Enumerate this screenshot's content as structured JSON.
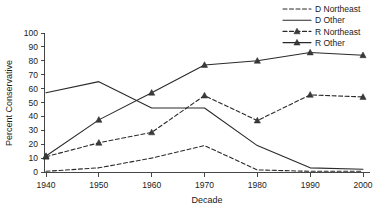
{
  "chart_data": {
    "type": "line",
    "title": "",
    "xlabel": "Decade",
    "ylabel": "Percent Conservative",
    "x": [
      1940,
      1950,
      1960,
      1970,
      1980,
      1990,
      2000
    ],
    "xticklabels": [
      "1940",
      "1950",
      "1960",
      "1970",
      "1980",
      "1990",
      "2000"
    ],
    "yticklabels": [
      "0",
      "10",
      "20",
      "30",
      "40",
      "50",
      "60",
      "70",
      "80",
      "90",
      "100"
    ],
    "xlim": [
      1940,
      2000
    ],
    "ylim": [
      0,
      100
    ],
    "ytick_step": 10,
    "grid": false,
    "legend_position": "top-right",
    "series": [
      {
        "name": "D Northeast",
        "style": "dashed",
        "marker": "none",
        "color": "#2a2a2a",
        "values": [
          0.5,
          3,
          10,
          19,
          1.5,
          0.5,
          0.5
        ]
      },
      {
        "name": "D Other",
        "style": "solid",
        "marker": "none",
        "color": "#2a2a2a",
        "values": [
          57,
          65,
          46,
          46,
          19,
          3,
          2
        ]
      },
      {
        "name": "R Northeast",
        "style": "dashed",
        "marker": "triangle",
        "color": "#2a2a2a",
        "values": [
          11,
          21,
          28.5,
          55,
          37,
          55.5,
          54
        ]
      },
      {
        "name": "R Other",
        "style": "solid",
        "marker": "triangle",
        "color": "#2a2a2a",
        "values": [
          11.5,
          37.5,
          57,
          77,
          80,
          86,
          84
        ]
      }
    ]
  },
  "axes": {
    "x_title": "Decade",
    "y_title": "Percent Conservative"
  },
  "legend": {
    "entries": [
      {
        "label": "D Northeast"
      },
      {
        "label": "D Other"
      },
      {
        "label": "R Northeast"
      },
      {
        "label": "R Other"
      }
    ]
  }
}
